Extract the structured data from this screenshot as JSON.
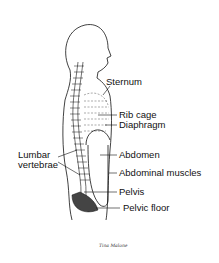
{
  "diagram": {
    "labels": {
      "sternum": "Sternum",
      "rib_cage": "Rib cage",
      "diaphragm": "Diaphragm",
      "lumbar_line1": "Lumbar",
      "lumbar_line2": "vertebrae",
      "abdomen": "Abdomen",
      "abdominal_muscles": "Abdominal muscles",
      "pelvis": "Pelvis",
      "pelvic_floor": "Pelvic floor"
    },
    "signature": "Tina Malone",
    "colors": {
      "ink": "#111111",
      "background": "#ffffff"
    }
  }
}
